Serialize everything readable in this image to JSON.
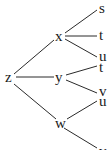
{
  "tree": {
    "nodes": [
      {
        "id": "z",
        "label": "z",
        "x": 9,
        "y": 82
      },
      {
        "id": "x",
        "label": "x",
        "x": 59,
        "y": 41
      },
      {
        "id": "y",
        "label": "y",
        "x": 60,
        "y": 80
      },
      {
        "id": "w",
        "label": "w",
        "x": 61,
        "y": 125
      },
      {
        "id": "s",
        "label": "s",
        "x": 102,
        "y": 10
      },
      {
        "id": "t1",
        "label": "t",
        "x": 102,
        "y": 37
      },
      {
        "id": "u1",
        "label": "u",
        "x": 102,
        "y": 57
      },
      {
        "id": "t2",
        "label": "t",
        "x": 102,
        "y": 70
      },
      {
        "id": "v",
        "label": "v",
        "x": 102,
        "y": 93
      },
      {
        "id": "u2",
        "label": "u",
        "x": 102,
        "y": 103
      },
      {
        "id": "v2",
        "label": "v",
        "x": 102,
        "y": 152
      }
    ],
    "edges": [
      [
        "z",
        "x"
      ],
      [
        "z",
        "y"
      ],
      [
        "z",
        "w"
      ],
      [
        "x",
        "s"
      ],
      [
        "x",
        "t1"
      ],
      [
        "x",
        "u1"
      ],
      [
        "y",
        "t2"
      ],
      [
        "y",
        "v"
      ],
      [
        "w",
        "u2"
      ],
      [
        "w",
        "v2"
      ]
    ]
  }
}
